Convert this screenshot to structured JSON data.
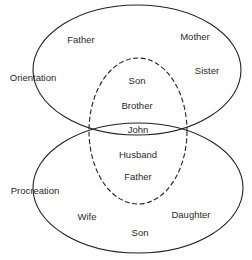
{
  "diagram": {
    "type": "venn",
    "sets": [
      {
        "name": "Orientation",
        "label": "Orientation",
        "style": "solid",
        "members": [
          "Father",
          "Mother",
          "Sister",
          "Son",
          "Brother",
          "John"
        ]
      },
      {
        "name": "Procreation",
        "label": "Procreation",
        "style": "solid",
        "members": [
          "John",
          "Husband",
          "Father",
          "Wife",
          "Daughter",
          "Son"
        ]
      },
      {
        "name": "John's roles",
        "label": "",
        "style": "dashed",
        "members": [
          "Son",
          "Brother",
          "John",
          "Husband",
          "Father"
        ]
      }
    ],
    "labels": {
      "orientation": "Orientation",
      "procreation": "Procreation",
      "top_father": "Father",
      "top_mother": "Mother",
      "top_sister": "Sister",
      "inner_son": "Son",
      "inner_brother": "Brother",
      "center_john": "John",
      "inner_husband": "Husband",
      "inner_father": "Father",
      "bottom_wife": "Wife",
      "bottom_daughter": "Daughter",
      "bottom_son": "Son"
    },
    "colors": {
      "stroke": "#222222",
      "text": "#2a2a2a",
      "background": "#ffffff"
    }
  }
}
